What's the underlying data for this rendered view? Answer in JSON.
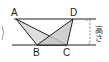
{
  "diagram": {
    "type": "geometry",
    "points": {
      "A": {
        "label": "A",
        "x": 16,
        "y": 19
      },
      "D": {
        "label": "D",
        "x": 73,
        "y": 19
      },
      "B": {
        "label": "B",
        "x": 37,
        "y": 45
      },
      "C": {
        "label": "C",
        "x": 67,
        "y": 45
      }
    },
    "height_label": "高さ",
    "colors": {
      "line": "#222222",
      "fill": "#cfcfcf",
      "bracket": "#888888"
    }
  }
}
